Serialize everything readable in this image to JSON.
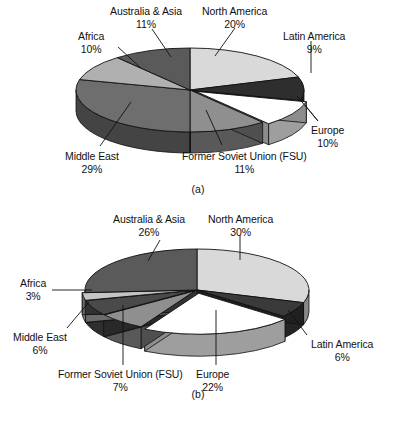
{
  "figure": {
    "type": "two-panel-pie-figure",
    "background": "#ffffff",
    "panels": [
      {
        "id": "a",
        "caption": "(a)"
      },
      {
        "id": "b",
        "caption": "(b)"
      }
    ]
  },
  "chart_data": [
    {
      "type": "pie",
      "title": "(a)",
      "caption": "(a)",
      "legend_position": "none",
      "labels_mode": "leader-lines-outside",
      "categories": [
        "North America",
        "Latin America",
        "Europe",
        "Former Soviet Union (FSU)",
        "Middle East",
        "Africa",
        "Australia & Asia"
      ],
      "values": [
        20,
        9,
        10,
        11,
        29,
        10,
        11
      ],
      "value_labels": [
        "20%",
        "9%",
        "10%",
        "11%",
        "29%",
        "10%",
        "11%"
      ],
      "units": "percent",
      "colors": [
        "#d9d9d9",
        "#2e2e2e",
        "#ffffff",
        "#8f8f8f",
        "#6e6e6e",
        "#b0b0b0",
        "#5a5a5a"
      ],
      "slices": [
        {
          "label": "North America",
          "value": 20,
          "value_label": "20%",
          "color": "#d9d9d9"
        },
        {
          "label": "Latin America",
          "value": 9,
          "value_label": "9%",
          "color": "#2e2e2e"
        },
        {
          "label": "Europe",
          "value": 10,
          "value_label": "10%",
          "color": "#ffffff"
        },
        {
          "label": "Former Soviet Union (FSU)",
          "value": 11,
          "value_label": "11%",
          "color": "#8f8f8f"
        },
        {
          "label": "Middle East",
          "value": 29,
          "value_label": "29%",
          "color": "#6e6e6e"
        },
        {
          "label": "Africa",
          "value": 10,
          "value_label": "10%",
          "color": "#b0b0b0"
        },
        {
          "label": "Australia & Asia",
          "value": 11,
          "value_label": "11%",
          "color": "#5a5a5a"
        }
      ]
    },
    {
      "type": "pie",
      "title": "(b)",
      "caption": "(b)",
      "legend_position": "none",
      "labels_mode": "leader-lines-outside",
      "categories": [
        "North America",
        "Latin America",
        "Europe",
        "Former Soviet Union (FSU)",
        "Middle East",
        "Africa",
        "Australia & Asia"
      ],
      "values": [
        30,
        6,
        22,
        7,
        6,
        3,
        26
      ],
      "value_labels": [
        "30%",
        "6%",
        "22%",
        "7%",
        "6%",
        "3%",
        "26%"
      ],
      "units": "percent",
      "colors": [
        "#d9d9d9",
        "#3a3a3a",
        "#ffffff",
        "#8f8f8f",
        "#4a4a4a",
        "#c4c4c4",
        "#5a5a5a"
      ],
      "slices": [
        {
          "label": "North America",
          "value": 30,
          "value_label": "30%",
          "color": "#d9d9d9"
        },
        {
          "label": "Latin America",
          "value": 6,
          "value_label": "6%",
          "color": "#3a3a3a"
        },
        {
          "label": "Europe",
          "value": 22,
          "value_label": "22%",
          "color": "#ffffff"
        },
        {
          "label": "Former Soviet Union (FSU)",
          "value": 7,
          "value_label": "7%",
          "color": "#8f8f8f"
        },
        {
          "label": "Middle East",
          "value": 6,
          "value_label": "6%",
          "color": "#4a4a4a"
        },
        {
          "label": "Africa",
          "value": 3,
          "value_label": "3%",
          "color": "#c4c4c4"
        },
        {
          "label": "Australia & Asia",
          "value": 26,
          "value_label": "26%",
          "color": "#5a5a5a"
        }
      ]
    }
  ],
  "chart_a": {
    "caption": "(a)",
    "labels": {
      "australia_asia": {
        "name": "Australia & Asia",
        "pct": "11%"
      },
      "north_america": {
        "name": "North America",
        "pct": "20%"
      },
      "latin_america": {
        "name": "Latin America",
        "pct": "9%"
      },
      "africa": {
        "name": "Africa",
        "pct": "10%"
      },
      "europe": {
        "name": "Europe",
        "pct": "10%"
      },
      "middle_east": {
        "name": "Middle East",
        "pct": "29%"
      },
      "fsu": {
        "name": "Former Soviet Union (FSU)",
        "pct": "11%"
      }
    }
  },
  "chart_b": {
    "caption": "(b)",
    "labels": {
      "australia_asia": {
        "name": "Australia & Asia",
        "pct": "26%"
      },
      "north_america": {
        "name": "North America",
        "pct": "30%"
      },
      "africa": {
        "name": "Africa",
        "pct": "3%"
      },
      "latin_america": {
        "name": "Latin America",
        "pct": "6%"
      },
      "middle_east": {
        "name": "Middle East",
        "pct": "6%"
      },
      "fsu": {
        "name": "Former Soviet Union (FSU)",
        "pct": "7%"
      },
      "europe": {
        "name": "Europe",
        "pct": "22%"
      }
    }
  }
}
